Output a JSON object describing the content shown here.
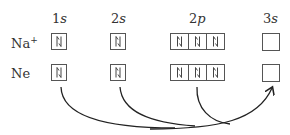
{
  "orbitals": [
    {
      "number": "1",
      "letter": "s",
      "electrons": 2
    },
    {
      "number": "2",
      "letter": "s",
      "electrons": 2
    },
    {
      "number": "2",
      "letter": "p",
      "electrons": 6
    },
    {
      "number": "3",
      "letter": "s",
      "electrons": 0
    }
  ],
  "rows": [
    {
      "species": "Na",
      "charge": "+"
    },
    {
      "species": "Ne",
      "charge": ""
    }
  ],
  "paired_symbol": "⇅",
  "arrows_note": "Curved arrows from Ne 1s, 2s and 2p to the empty 3s orbital"
}
